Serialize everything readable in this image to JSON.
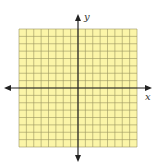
{
  "diagram": {
    "type": "coordinate-plane",
    "x_axis_label": "x",
    "y_axis_label": "y",
    "grid_cells_x": 16,
    "grid_cells_y": 16,
    "colors": {
      "grid_fill": "#fbf5a8",
      "grid_line": "#9a9560",
      "axis": "#222222"
    }
  }
}
